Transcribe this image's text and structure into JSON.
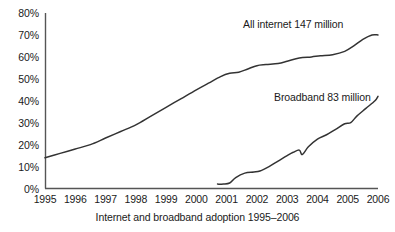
{
  "chart_data": {
    "type": "line",
    "title": "",
    "caption": "Internet and broadband adoption 1995–2006",
    "xlabel": "",
    "ylabel": "",
    "xlim": [
      1995,
      2006
    ],
    "ylim": [
      0,
      80
    ],
    "grid": false,
    "legend_position": "inline-annotation",
    "y_ticks": [
      "0%",
      "10%",
      "20%",
      "30%",
      "40%",
      "50%",
      "60%",
      "70%",
      "80%"
    ],
    "y_tick_values": [
      0,
      10,
      20,
      30,
      40,
      50,
      60,
      70,
      80
    ],
    "x_ticks": [
      "1995",
      "1996",
      "1997",
      "1998",
      "1999",
      "2000",
      "2001",
      "2002",
      "2003",
      "2004",
      "2005",
      "2006"
    ],
    "x_tick_values": [
      1995,
      1996,
      1997,
      1998,
      1999,
      2000,
      2001,
      2002,
      2003,
      2004,
      2005,
      2006
    ],
    "series": [
      {
        "name": "All internet 147 million",
        "annotation": "All internet 147 million",
        "color": "#333333",
        "x": [
          1995.0,
          1995.5,
          1996.0,
          1996.5,
          1997.0,
          1997.5,
          1998.0,
          1998.5,
          1999.0,
          1999.5,
          2000.0,
          2000.4,
          2000.8,
          2001.1,
          2001.4,
          2001.7,
          2002.0,
          2002.3,
          2002.7,
          2003.0,
          2003.4,
          2003.8,
          2004.1,
          2004.5,
          2004.9,
          2005.2,
          2005.5,
          2005.8,
          2006.0
        ],
        "values": [
          14,
          16,
          18,
          20,
          23,
          26,
          29,
          33,
          37,
          41,
          45,
          48,
          51,
          52.5,
          53,
          54.5,
          56,
          56.5,
          57,
          58,
          59.5,
          60,
          60.5,
          61,
          62.5,
          65,
          68,
          70,
          70
        ]
      },
      {
        "name": "Broadband 83 million",
        "annotation": "Broadband 83 million",
        "color": "#333333",
        "x": [
          2000.7,
          2000.9,
          2001.1,
          2001.3,
          2001.6,
          2001.9,
          2002.1,
          2002.4,
          2002.7,
          2003.0,
          2003.2,
          2003.4,
          2003.5,
          2003.7,
          2004.0,
          2004.3,
          2004.6,
          2004.9,
          2005.1,
          2005.3,
          2005.6,
          2005.9,
          2006.0
        ],
        "values": [
          2,
          2,
          2.5,
          5,
          7,
          7.5,
          8,
          10,
          12.5,
          15,
          16.5,
          17.5,
          15.5,
          19,
          22.5,
          24.5,
          27,
          29.5,
          30,
          33,
          36.5,
          40,
          42
        ]
      }
    ]
  }
}
